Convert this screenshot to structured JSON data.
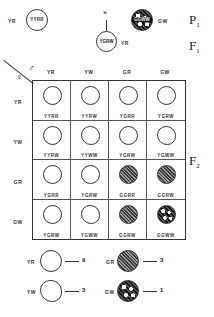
{
  "generations": {
    "p1": {
      "label": "P",
      "sub": "1"
    },
    "f1": {
      "label": "F",
      "sub": "1"
    },
    "f2": {
      "label": "F",
      "sub": "2"
    }
  },
  "parents": {
    "left": {
      "phenotype": "YR",
      "genotype": "YYRR",
      "fill": "plain"
    },
    "cross_symbol": "×",
    "right": {
      "phenotype": "GW",
      "genotype": "GGWW",
      "fill": "green-wrinkled"
    }
  },
  "f1_offspring": {
    "phenotype": "YR",
    "genotype": "YGRW",
    "fill": "plain"
  },
  "punnett": {
    "male_symbol": "♂",
    "female_symbol": "♀",
    "columns": [
      "YR",
      "YW",
      "GR",
      "GW"
    ],
    "rows": [
      "YR",
      "YW",
      "GR",
      "GW"
    ],
    "cells": [
      [
        {
          "g": "YYRR",
          "f": "plain"
        },
        {
          "g": "YYRW",
          "f": "plain"
        },
        {
          "g": "YGRR",
          "f": "plain"
        },
        {
          "g": "YGRW",
          "f": "plain"
        }
      ],
      [
        {
          "g": "YYRW",
          "f": "plain"
        },
        {
          "g": "YYWW",
          "f": "wrinkled"
        },
        {
          "g": "YGRW",
          "f": "plain"
        },
        {
          "g": "YGWW",
          "f": "wrinkled"
        }
      ],
      [
        {
          "g": "YGRR",
          "f": "plain"
        },
        {
          "g": "YGRW",
          "f": "plain"
        },
        {
          "g": "GGRR",
          "f": "green"
        },
        {
          "g": "GGRW",
          "f": "green"
        }
      ],
      [
        {
          "g": "YGRW",
          "f": "plain"
        },
        {
          "g": "YGWW",
          "f": "wrinkled"
        },
        {
          "g": "GGRW",
          "f": "green"
        },
        {
          "g": "GGWW",
          "f": "green-wrinkled"
        }
      ]
    ]
  },
  "ratios": [
    {
      "phenotype": "YR",
      "count": "9",
      "fill": "plain"
    },
    {
      "phenotype": "GR",
      "count": "3",
      "fill": "green"
    },
    {
      "phenotype": "YW",
      "count": "3",
      "fill": "wrinkled"
    },
    {
      "phenotype": "GW",
      "count": "1",
      "fill": "green-wrinkled"
    }
  ]
}
